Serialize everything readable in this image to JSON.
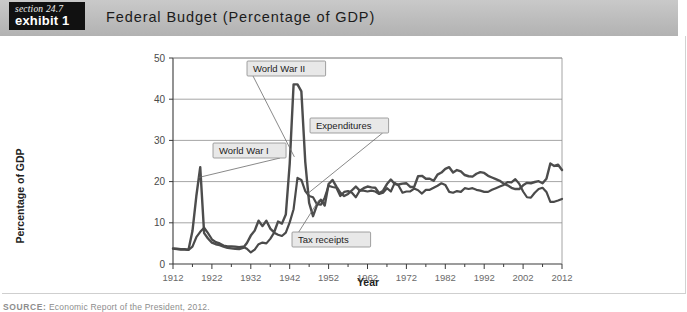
{
  "header": {
    "badge_section": "section 24.7",
    "badge_exhibit": "exhibit 1",
    "title": "Federal Budget (Percentage of GDP)"
  },
  "footer": {
    "source_label": "SOURCE:",
    "source_text": " Economic Report of the President, 2012."
  },
  "chart_data": {
    "type": "line",
    "title": "Federal Budget (Percentage of GDP)",
    "xlabel": "Year",
    "ylabel": "Percentage of GDP",
    "xlim": [
      1912,
      2012
    ],
    "ylim": [
      0,
      50
    ],
    "yticks": [
      0,
      10,
      20,
      30,
      40,
      50
    ],
    "xticks": [
      1912,
      1922,
      1932,
      1942,
      1952,
      1962,
      1972,
      1982,
      1992,
      2002,
      2012
    ],
    "grid": "horizontal",
    "legend": "annotations",
    "annotations": [
      {
        "label": "World War II",
        "target_year": 1944,
        "target_value": 43
      },
      {
        "label": "World War I",
        "target_year": 1918,
        "target_value": 20
      },
      {
        "label": "Expenditures",
        "target_year": 1947,
        "target_value": 16
      },
      {
        "label": "Tax receipts",
        "target_year": 1949,
        "target_value": 15
      }
    ],
    "series": [
      {
        "name": "Expenditures",
        "x": [
          1912,
          1913,
          1914,
          1915,
          1916,
          1917,
          1918,
          1919,
          1920,
          1921,
          1922,
          1923,
          1924,
          1925,
          1926,
          1927,
          1928,
          1929,
          1930,
          1931,
          1932,
          1933,
          1934,
          1935,
          1936,
          1937,
          1938,
          1939,
          1940,
          1941,
          1942,
          1943,
          1944,
          1945,
          1946,
          1947,
          1948,
          1949,
          1950,
          1951,
          1952,
          1953,
          1954,
          1955,
          1956,
          1957,
          1958,
          1959,
          1960,
          1961,
          1962,
          1963,
          1964,
          1965,
          1966,
          1967,
          1968,
          1969,
          1970,
          1971,
          1972,
          1973,
          1974,
          1975,
          1976,
          1977,
          1978,
          1979,
          1980,
          1981,
          1982,
          1983,
          1984,
          1985,
          1986,
          1987,
          1988,
          1989,
          1990,
          1991,
          1992,
          1993,
          1994,
          1995,
          1996,
          1997,
          1998,
          1999,
          2000,
          2001,
          2002,
          2003,
          2004,
          2005,
          2006,
          2007,
          2008,
          2009,
          2010,
          2011,
          2012
        ],
        "y": [
          3.8,
          3.7,
          3.6,
          3.6,
          3.5,
          8.0,
          16.5,
          23.5,
          7.5,
          6.2,
          5.2,
          4.8,
          4.6,
          4.2,
          3.9,
          3.8,
          3.7,
          3.6,
          3.9,
          5.1,
          6.9,
          8.1,
          10.5,
          9.2,
          10.5,
          8.6,
          7.7,
          10.3,
          9.8,
          12.0,
          24.3,
          43.6,
          43.6,
          41.9,
          24.8,
          14.8,
          11.6,
          14.3,
          15.6,
          14.2,
          19.4,
          20.4,
          18.8,
          17.3,
          16.5,
          17.0,
          17.9,
          18.8,
          17.8,
          18.4,
          18.8,
          18.6,
          18.5,
          17.2,
          17.8,
          19.4,
          20.5,
          19.4,
          19.3,
          19.5,
          19.6,
          18.7,
          18.7,
          21.3,
          21.4,
          20.7,
          20.7,
          20.2,
          21.7,
          22.2,
          23.1,
          23.5,
          22.2,
          22.8,
          22.5,
          21.6,
          21.3,
          21.2,
          21.9,
          22.3,
          22.1,
          21.4,
          21.0,
          20.6,
          20.2,
          19.5,
          19.1,
          18.5,
          18.2,
          18.2,
          19.1,
          19.7,
          19.6,
          19.9,
          20.1,
          19.6,
          20.7,
          24.4,
          23.8,
          24.1,
          22.8
        ]
      },
      {
        "name": "Tax receipts",
        "x": [
          1912,
          1913,
          1914,
          1915,
          1916,
          1917,
          1918,
          1919,
          1920,
          1921,
          1922,
          1923,
          1924,
          1925,
          1926,
          1927,
          1928,
          1929,
          1930,
          1931,
          1932,
          1933,
          1934,
          1935,
          1936,
          1937,
          1938,
          1939,
          1940,
          1941,
          1942,
          1943,
          1944,
          1945,
          1946,
          1947,
          1948,
          1949,
          1950,
          1951,
          1952,
          1953,
          1954,
          1955,
          1956,
          1957,
          1958,
          1959,
          1960,
          1961,
          1962,
          1963,
          1964,
          1965,
          1966,
          1967,
          1968,
          1969,
          1970,
          1971,
          1972,
          1973,
          1974,
          1975,
          1976,
          1977,
          1978,
          1979,
          1980,
          1981,
          1982,
          1983,
          1984,
          1985,
          1986,
          1987,
          1988,
          1989,
          1990,
          1991,
          1992,
          1993,
          1994,
          1995,
          1996,
          1997,
          1998,
          1999,
          2000,
          2001,
          2002,
          2003,
          2004,
          2005,
          2006,
          2007,
          2008,
          2009,
          2010,
          2011,
          2012
        ],
        "y": [
          3.7,
          3.6,
          3.5,
          3.5,
          3.4,
          4.2,
          6.5,
          7.8,
          8.8,
          7.5,
          6.0,
          5.3,
          5.0,
          4.5,
          4.3,
          4.3,
          4.2,
          4.1,
          4.2,
          3.7,
          2.8,
          3.5,
          4.8,
          5.2,
          5.0,
          6.1,
          7.6,
          7.1,
          6.8,
          7.6,
          10.1,
          13.3,
          20.9,
          20.4,
          17.7,
          16.5,
          16.2,
          14.5,
          14.4,
          16.1,
          19.0,
          18.7,
          18.5,
          16.5,
          17.5,
          17.7,
          17.3,
          16.2,
          17.8,
          17.8,
          17.6,
          17.8,
          17.6,
          17.0,
          17.3,
          18.4,
          17.6,
          19.7,
          19.0,
          17.3,
          17.6,
          17.6,
          18.3,
          17.9,
          17.1,
          18.0,
          18.0,
          18.5,
          19.0,
          19.6,
          19.2,
          17.5,
          17.3,
          17.7,
          17.5,
          18.4,
          18.2,
          18.4,
          18.0,
          17.8,
          17.5,
          17.5,
          18.0,
          18.4,
          18.8,
          19.2,
          19.9,
          19.8,
          20.6,
          19.5,
          17.6,
          16.2,
          16.1,
          17.3,
          18.2,
          18.5,
          17.5,
          15.1,
          15.1,
          15.4,
          15.8
        ]
      }
    ]
  }
}
